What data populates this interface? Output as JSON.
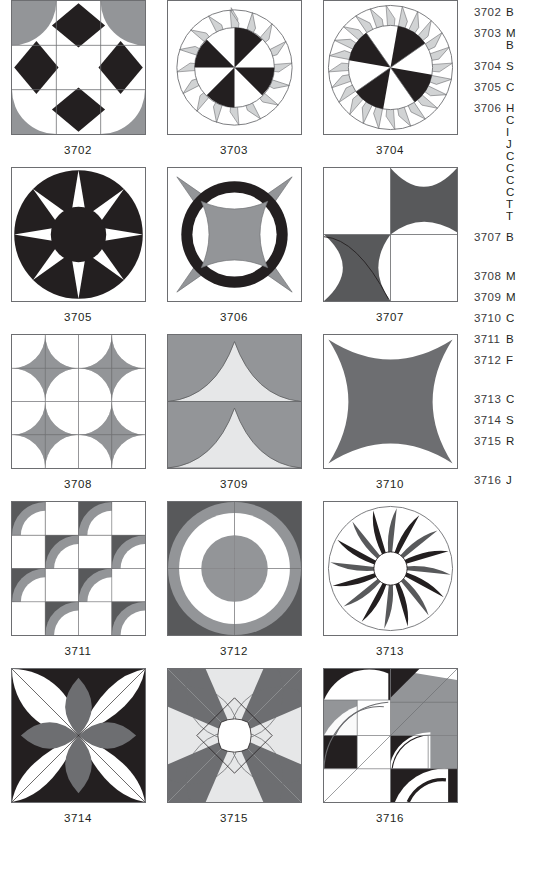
{
  "page": {
    "kind": "quilt-block-pattern-catalog",
    "columns": 3,
    "palette": {
      "black": "#231f20",
      "dark_gray": "#58595b",
      "mid_gray": "#939598",
      "light_gray": "#d1d3d4",
      "pale_gray": "#e6e7e8",
      "white": "#ffffff",
      "outline": "#6d6e71",
      "text": "#231f20"
    }
  },
  "blocks": [
    {
      "id": "3702",
      "caption": "3702",
      "pattern": "nine-patch-with-corner-quarter-circles-and-diamonds",
      "colors": [
        "#939598",
        "#231f20",
        "#ffffff"
      ]
    },
    {
      "id": "3703",
      "caption": "3703",
      "pattern": "eight-wedge-pinwheel-with-outer-spike-ring",
      "colors": [
        "#231f20",
        "#d1d3d4",
        "#ffffff"
      ],
      "wedges": 8,
      "spikes": 16
    },
    {
      "id": "3704",
      "caption": "3704",
      "pattern": "pinwheel-with-dense-mariner-spike-ring",
      "colors": [
        "#231f20",
        "#d1d3d4",
        "#ffffff"
      ],
      "wedges": 8,
      "spikes": 24
    },
    {
      "id": "3705",
      "caption": "3705",
      "pattern": "eight-point-star-in-circle",
      "colors": [
        "#231f20",
        "#ffffff"
      ],
      "points": 8
    },
    {
      "id": "3706",
      "caption": "3706",
      "pattern": "black-ring-with-concave-center-and-corner-petals",
      "colors": [
        "#231f20",
        "#939598",
        "#ffffff"
      ]
    },
    {
      "id": "3707",
      "caption": "3707",
      "pattern": "two-quadrant-curved-points",
      "colors": [
        "#58595b",
        "#ffffff"
      ]
    },
    {
      "id": "3708",
      "caption": "3708",
      "pattern": "four-by-four-drunkards-path-rotation",
      "colors": [
        "#58595b",
        "#939598",
        "#ffffff"
      ],
      "units": 16
    },
    {
      "id": "3709",
      "caption": "3709",
      "pattern": "two-row-concave-triangles",
      "colors": [
        "#939598",
        "#e6e7e8",
        "#ffffff"
      ]
    },
    {
      "id": "3710",
      "caption": "3710",
      "pattern": "four-point-concave-star",
      "colors": [
        "#6d6e71",
        "#ffffff"
      ]
    },
    {
      "id": "3711",
      "caption": "3711",
      "pattern": "checkerboard-curved-quarter-units",
      "colors": [
        "#58595b",
        "#939598",
        "#ffffff"
      ],
      "units": 16
    },
    {
      "id": "3712",
      "caption": "3712",
      "pattern": "four-unit-curved-pinwheel",
      "colors": [
        "#58595b",
        "#939598",
        "#ffffff"
      ],
      "units": 4
    },
    {
      "id": "3713",
      "caption": "3713",
      "pattern": "sixteen-blade-curved-fan-wheel",
      "colors": [
        "#231f20",
        "#58595b",
        "#ffffff"
      ],
      "blades": 16
    },
    {
      "id": "3714",
      "caption": "3714",
      "pattern": "overlapping-circles-orange-peel-with-gray-petals",
      "colors": [
        "#231f20",
        "#6d6e71",
        "#ffffff"
      ]
    },
    {
      "id": "3715",
      "caption": "3715",
      "pattern": "eight-point-star-with-scalloped-center",
      "colors": [
        "#6d6e71",
        "#e6e7e8",
        "#ffffff"
      ]
    },
    {
      "id": "3716",
      "caption": "3716",
      "pattern": "curved-log-cabin-quarter-arcs",
      "colors": [
        "#231f20",
        "#939598",
        "#ffffff"
      ]
    }
  ],
  "index": {
    "entries": [
      {
        "number": "3702",
        "text": "B",
        "continuations": []
      },
      {
        "number": "3703",
        "text": "M",
        "continuations": [
          "B"
        ]
      },
      {
        "number": "3704",
        "text": "S",
        "continuations": []
      },
      {
        "number": "3705",
        "text": "C",
        "continuations": []
      },
      {
        "number": "3706",
        "text": "H",
        "continuations": [
          "C",
          "I",
          "J",
          "C",
          "C",
          "C",
          "C",
          "T",
          "T"
        ]
      },
      {
        "number": "3707",
        "text": "B",
        "continuations": []
      },
      {
        "number": "3708",
        "text": "M",
        "continuations": []
      },
      {
        "number": "3709",
        "text": "M",
        "continuations": []
      },
      {
        "number": "3710",
        "text": "C",
        "continuations": []
      },
      {
        "number": "3711",
        "text": "B",
        "continuations": []
      },
      {
        "number": "3712",
        "text": "F",
        "continuations": []
      },
      {
        "number": "3713",
        "text": "C",
        "continuations": []
      },
      {
        "number": "3714",
        "text": "S",
        "continuations": []
      },
      {
        "number": "3715",
        "text": "R",
        "continuations": []
      },
      {
        "number": "3716",
        "text": "J",
        "continuations": []
      }
    ]
  }
}
